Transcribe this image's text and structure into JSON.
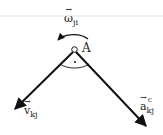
{
  "diagram": {
    "point_label": "A",
    "omega": {
      "symbol": "ω",
      "subscript": "ji",
      "arrow": "→"
    },
    "velocity": {
      "symbol": "v",
      "subscript": "kj",
      "arrow": "→"
    },
    "acceleration": {
      "symbol": "a",
      "subscript": "kj",
      "superscript": "c",
      "arrow": "→"
    },
    "colors": {
      "line": "#111111",
      "rule": "#dddddd"
    }
  }
}
